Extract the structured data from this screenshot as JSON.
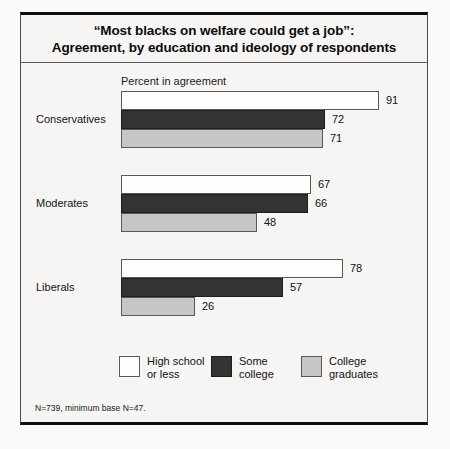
{
  "figure": {
    "title_line1": "“Most blacks on welfare could get a job”:",
    "title_line2": "Agreement, by education and ideology of respondents",
    "axis_caption": "Percent in agreement",
    "footnote": "N=739, minimum base N=47."
  },
  "legend": {
    "items": [
      {
        "label_line1": "High school",
        "label_line2": "or less",
        "color": "#fdfdfc"
      },
      {
        "label_line1": "Some",
        "label_line2": "college",
        "color": "#333333"
      },
      {
        "label_line1": "College",
        "label_line2": "graduates",
        "color": "#c6c6c6"
      }
    ]
  },
  "chart_data": {
    "type": "bar",
    "orientation": "horizontal",
    "title": "“Most blacks on welfare could get a job”: Agreement, by education and ideology of respondents",
    "xlabel": "Percent in agreement",
    "ylabel": "",
    "xlim": [
      0,
      100
    ],
    "grid": false,
    "legend_position": "bottom",
    "categories": [
      "Conservatives",
      "Moderates",
      "Liberals"
    ],
    "series": [
      {
        "name": "High school or less",
        "color": "#fdfdfc",
        "values": [
          91,
          67,
          78
        ]
      },
      {
        "name": "Some college",
        "color": "#333333",
        "values": [
          72,
          66,
          57
        ]
      },
      {
        "name": "College graduates",
        "color": "#c6c6c6",
        "values": [
          71,
          48,
          26
        ]
      }
    ],
    "value_labels": [
      [
        "91",
        "72",
        "71"
      ],
      [
        "67",
        "66",
        "48"
      ],
      [
        "78",
        "57",
        "26"
      ]
    ],
    "note": "N=739, minimum base N=47."
  }
}
